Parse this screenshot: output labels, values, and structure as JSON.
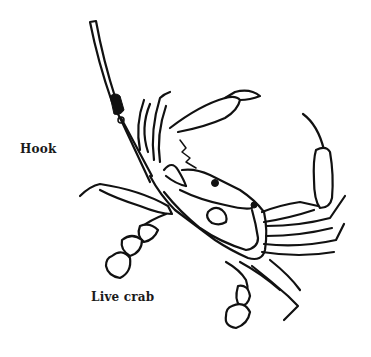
{
  "figure": {
    "labels": {
      "hook": "Hook",
      "crab": "Live crab"
    },
    "ink_color": "#111111",
    "background_color": "#ffffff"
  }
}
